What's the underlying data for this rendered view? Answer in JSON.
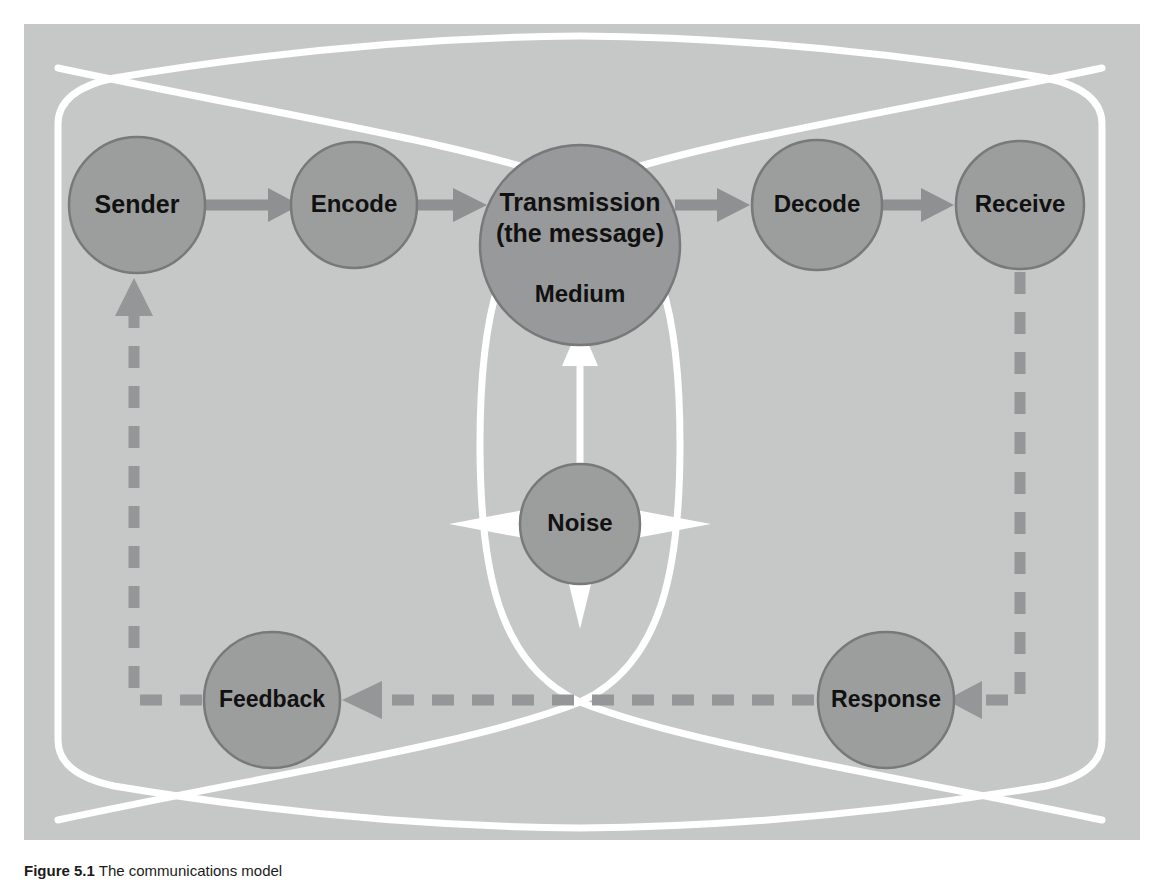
{
  "figure": {
    "caption_number": "Figure 5.1",
    "caption_text": "The communications model",
    "panel_bg": "#c6c7c7",
    "node_fill": "#9c9d9d",
    "node_stroke": "#77797a",
    "arrow_color": "#8e9091",
    "dash_color": "#949697",
    "accent_white": "#ffffff"
  },
  "diagram": {
    "type": "flow-diagram",
    "title": "Communications model",
    "nodes": [
      {
        "id": "sender",
        "label": "Sender",
        "cx": 113,
        "cy": 181,
        "r": 68
      },
      {
        "id": "encode",
        "label": "Encode",
        "cx": 330,
        "cy": 181,
        "r": 63
      },
      {
        "id": "transmission",
        "label": "Transmission",
        "label2": "(the message)",
        "label3": "Medium",
        "cx": 556,
        "cy": 221,
        "r": 100
      },
      {
        "id": "decode",
        "label": "Decode",
        "cx": 793,
        "cy": 181,
        "r": 65
      },
      {
        "id": "receive",
        "label": "Receive",
        "cx": 996,
        "cy": 181,
        "r": 64
      },
      {
        "id": "noise",
        "label": "Noise",
        "cx": 556,
        "cy": 500,
        "r": 60
      },
      {
        "id": "feedback",
        "label": "Feedback",
        "cx": 248,
        "cy": 676,
        "r": 68
      },
      {
        "id": "response",
        "label": "Response",
        "cx": 862,
        "cy": 676,
        "r": 68
      }
    ],
    "edges": [
      {
        "from": "sender",
        "to": "encode",
        "style": "solid",
        "direction": "right"
      },
      {
        "from": "encode",
        "to": "transmission",
        "style": "solid",
        "direction": "right"
      },
      {
        "from": "transmission",
        "to": "decode",
        "style": "solid",
        "direction": "right"
      },
      {
        "from": "decode",
        "to": "receive",
        "style": "solid",
        "direction": "right"
      },
      {
        "from": "receive",
        "to": "response",
        "style": "dashed",
        "direction": "down-left"
      },
      {
        "from": "response",
        "to": "feedback",
        "style": "dashed",
        "direction": "left"
      },
      {
        "from": "feedback",
        "to": "sender",
        "style": "dashed",
        "direction": "left-up"
      },
      {
        "from": "noise",
        "to": "transmission",
        "style": "white-arrow",
        "direction": "up"
      },
      {
        "from": "noise",
        "to": "outward",
        "style": "white-burst",
        "direction": "four-way"
      }
    ]
  }
}
